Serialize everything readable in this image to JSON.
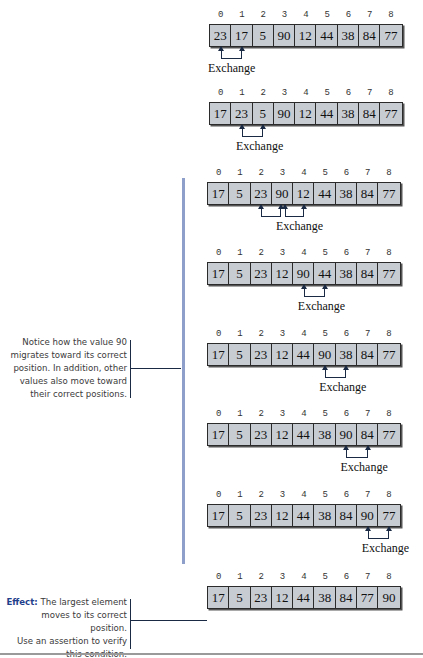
{
  "figure": {
    "indices": [
      "0",
      "1",
      "2",
      "3",
      "4",
      "5",
      "6",
      "7",
      "8"
    ],
    "exchange_label": "Exchange",
    "rows": [
      {
        "values": [
          "23",
          "17",
          "5",
          "90",
          "12",
          "44",
          "38",
          "84",
          "77"
        ],
        "swaps": [
          [
            0,
            1
          ]
        ]
      },
      {
        "values": [
          "17",
          "23",
          "5",
          "90",
          "12",
          "44",
          "38",
          "84",
          "77"
        ],
        "swaps": [
          [
            1,
            2
          ]
        ]
      },
      {
        "values": [
          "17",
          "5",
          "23",
          "90",
          "12",
          "44",
          "38",
          "84",
          "77"
        ],
        "swaps": [
          [
            2,
            3
          ],
          [
            3,
            4
          ]
        ]
      },
      {
        "values": [
          "17",
          "5",
          "23",
          "12",
          "90",
          "44",
          "38",
          "84",
          "77"
        ],
        "swaps": [
          [
            4,
            5
          ]
        ]
      },
      {
        "values": [
          "17",
          "5",
          "23",
          "12",
          "44",
          "90",
          "38",
          "84",
          "77"
        ],
        "swaps": [
          [
            5,
            6
          ]
        ]
      },
      {
        "values": [
          "17",
          "5",
          "23",
          "12",
          "44",
          "38",
          "90",
          "84",
          "77"
        ],
        "swaps": [
          [
            6,
            7
          ]
        ]
      },
      {
        "values": [
          "17",
          "5",
          "23",
          "12",
          "44",
          "38",
          "84",
          "90",
          "77"
        ],
        "swaps": [
          [
            7,
            8
          ]
        ]
      },
      {
        "values": [
          "17",
          "5",
          "23",
          "12",
          "44",
          "38",
          "84",
          "77",
          "90"
        ],
        "swaps": []
      }
    ]
  },
  "notes": {
    "migration": {
      "lines": [
        "Notice how the value 90",
        "migrates toward its correct",
        "position. In addition, other",
        "values also move toward",
        "their correct positions."
      ]
    },
    "effect": {
      "bold": "Effect:",
      "lines": [
        " The largest element",
        "moves to its correct position.",
        "Use an assertion to verify",
        "this condition."
      ]
    }
  },
  "colors": {
    "cell_fill": "#c7ccd3",
    "bracket_line": "#8e9fc9",
    "effect_label": "#1f3f8c"
  }
}
